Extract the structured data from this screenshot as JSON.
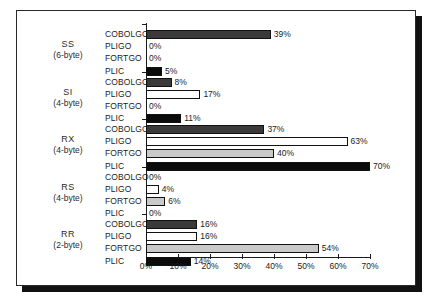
{
  "chart_data": {
    "type": "bar",
    "orientation": "horizontal",
    "title": "",
    "xlabel": "",
    "ylabel": "",
    "xlim": [
      0,
      70
    ],
    "xticks": [
      "0%",
      "10%",
      "20%",
      "30%",
      "40%",
      "50%",
      "60%",
      "70%"
    ],
    "xtick_values": [
      0,
      10,
      20,
      30,
      40,
      50,
      60,
      70
    ],
    "grid": false,
    "legend": "none",
    "series_names": [
      "COBOLGO",
      "PLIGO",
      "FORTGO",
      "PLIC"
    ],
    "series_colors": [
      "#3a3a3a",
      "#ffffff",
      "#c9c9c9",
      "#0b0b0b"
    ],
    "groups": [
      {
        "name": "SS",
        "sub": "(6-byte)",
        "bars": [
          {
            "series": "COBOLGO",
            "value": 39,
            "label": "39%"
          },
          {
            "series": "PLIGO",
            "value": 0,
            "label": "0%"
          },
          {
            "series": "FORTGO",
            "value": 0,
            "label": "0%"
          },
          {
            "series": "PLIC",
            "value": 5,
            "label": "5%"
          }
        ]
      },
      {
        "name": "SI",
        "sub": "(4-byte)",
        "bars": [
          {
            "series": "COBOLGO",
            "value": 8,
            "label": "8%"
          },
          {
            "series": "PLIGO",
            "value": 17,
            "label": "17%"
          },
          {
            "series": "FORTGO",
            "value": 0,
            "label": "0%"
          },
          {
            "series": "PLIC",
            "value": 11,
            "label": "11%"
          }
        ]
      },
      {
        "name": "RX",
        "sub": "(4-byte)",
        "bars": [
          {
            "series": "COBOLGO",
            "value": 37,
            "label": "37%"
          },
          {
            "series": "PLIGO",
            "value": 63,
            "label": "63%"
          },
          {
            "series": "FORTGO",
            "value": 40,
            "label": "40%"
          },
          {
            "series": "PLIC",
            "value": 70,
            "label": "70%"
          }
        ]
      },
      {
        "name": "RS",
        "sub": "(4-byte)",
        "bars": [
          {
            "series": "COBOLGO",
            "value": 0,
            "label": "0%"
          },
          {
            "series": "PLIGO",
            "value": 4,
            "label": "4%"
          },
          {
            "series": "FORTGO",
            "value": 6,
            "label": "6%"
          },
          {
            "series": "PLIC",
            "value": 0,
            "label": "0%"
          }
        ]
      },
      {
        "name": "RR",
        "sub": "(2-byte)",
        "bars": [
          {
            "series": "COBOLGO",
            "value": 16,
            "label": "16%"
          },
          {
            "series": "PLIGO",
            "value": 16,
            "label": "16%"
          },
          {
            "series": "FORTGO",
            "value": 54,
            "label": "54%"
          },
          {
            "series": "PLIC",
            "value": 14,
            "label": "14%"
          }
        ]
      }
    ]
  }
}
